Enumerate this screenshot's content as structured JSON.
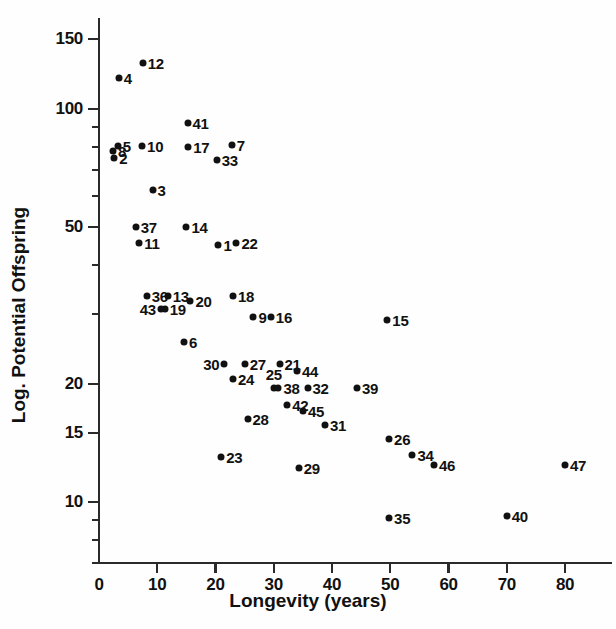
{
  "chart_data": {
    "type": "scatter",
    "title": "",
    "xlabel": "Longevity (years)",
    "ylabel": "Log. Potential Offspring",
    "xlim": [
      0,
      86
    ],
    "ylim": [
      7.0,
      170
    ],
    "yscale": "log",
    "xscale": "linear",
    "grid": false,
    "legend": "none",
    "xticks": [
      0,
      10,
      20,
      30,
      40,
      50,
      60,
      70,
      80
    ],
    "xticklabels": [
      "0",
      "10",
      "20",
      "30",
      "40",
      "50",
      "60",
      "70",
      "80"
    ],
    "yticks_major": [
      150,
      100,
      50,
      20,
      15,
      10
    ],
    "yticklabels": [
      "150",
      "100",
      "50",
      "20",
      "15",
      "10"
    ],
    "yticks_minor": [
      90,
      80,
      70,
      60,
      40,
      30,
      9,
      8,
      7
    ],
    "point_label_note": "Each marker is annotated with its species index number.",
    "points": [
      {
        "label": "1",
        "x": 20.5,
        "y": 45.0,
        "pos": "r"
      },
      {
        "label": "2",
        "x": 2.6,
        "y": 75.0,
        "pos": "r"
      },
      {
        "label": "3",
        "x": 9.2,
        "y": 62.0,
        "pos": "r"
      },
      {
        "label": "4",
        "x": 3.4,
        "y": 120.0,
        "pos": "r"
      },
      {
        "label": "5",
        "x": 3.2,
        "y": 80.5,
        "pos": "r"
      },
      {
        "label": "6",
        "x": 14.6,
        "y": 25.5,
        "pos": "r"
      },
      {
        "label": "7",
        "x": 22.8,
        "y": 81.0,
        "pos": "r"
      },
      {
        "label": "8",
        "x": 2.4,
        "y": 78.0,
        "pos": "r"
      },
      {
        "label": "9",
        "x": 26.5,
        "y": 29.5,
        "pos": "r"
      },
      {
        "label": "10",
        "x": 7.4,
        "y": 80.5,
        "pos": "r"
      },
      {
        "label": "11",
        "x": 6.9,
        "y": 45.5,
        "pos": "r"
      },
      {
        "label": "12",
        "x": 7.5,
        "y": 131.0,
        "pos": "r"
      },
      {
        "label": "13",
        "x": 11.8,
        "y": 33.5,
        "pos": "r"
      },
      {
        "label": "14",
        "x": 15.0,
        "y": 50.0,
        "pos": "r"
      },
      {
        "label": "15",
        "x": 49.5,
        "y": 29.0,
        "pos": "r"
      },
      {
        "label": "16",
        "x": 29.5,
        "y": 29.5,
        "pos": "r"
      },
      {
        "label": "17",
        "x": 15.3,
        "y": 80.0,
        "pos": "r"
      },
      {
        "label": "18",
        "x": 23.0,
        "y": 33.5,
        "pos": "r"
      },
      {
        "label": "19",
        "x": 11.3,
        "y": 31.0,
        "pos": "r"
      },
      {
        "label": "20",
        "x": 15.7,
        "y": 32.5,
        "pos": "r"
      },
      {
        "label": "21",
        "x": 31.0,
        "y": 22.5,
        "pos": "r"
      },
      {
        "label": "22",
        "x": 23.6,
        "y": 45.5,
        "pos": "r"
      },
      {
        "label": "23",
        "x": 21.0,
        "y": 13.0,
        "pos": "r"
      },
      {
        "label": "24",
        "x": 23.0,
        "y": 20.5,
        "pos": "r"
      },
      {
        "label": "25",
        "x": 30.0,
        "y": 19.5,
        "pos": "t"
      },
      {
        "label": "26",
        "x": 49.8,
        "y": 14.5,
        "pos": "r"
      },
      {
        "label": "27",
        "x": 25.0,
        "y": 22.5,
        "pos": "r"
      },
      {
        "label": "28",
        "x": 25.5,
        "y": 16.3,
        "pos": "r"
      },
      {
        "label": "29",
        "x": 34.3,
        "y": 12.2,
        "pos": "r"
      },
      {
        "label": "30",
        "x": 21.5,
        "y": 22.5,
        "pos": "l"
      },
      {
        "label": "31",
        "x": 38.8,
        "y": 15.7,
        "pos": "r"
      },
      {
        "label": "32",
        "x": 35.8,
        "y": 19.5,
        "pos": "r"
      },
      {
        "label": "33",
        "x": 20.2,
        "y": 74.0,
        "pos": "r"
      },
      {
        "label": "34",
        "x": 53.8,
        "y": 13.2,
        "pos": "r"
      },
      {
        "label": "35",
        "x": 49.8,
        "y": 9.1,
        "pos": "r"
      },
      {
        "label": "36",
        "x": 8.2,
        "y": 33.5,
        "pos": "r"
      },
      {
        "label": "37",
        "x": 6.3,
        "y": 50.0,
        "pos": "r"
      },
      {
        "label": "38",
        "x": 30.8,
        "y": 19.5,
        "pos": "r"
      },
      {
        "label": "39",
        "x": 44.3,
        "y": 19.5,
        "pos": "r"
      },
      {
        "label": "40",
        "x": 70.0,
        "y": 9.2,
        "pos": "r"
      },
      {
        "label": "41",
        "x": 15.2,
        "y": 92.0,
        "pos": "r"
      },
      {
        "label": "42",
        "x": 32.3,
        "y": 17.7,
        "pos": "r"
      },
      {
        "label": "43",
        "x": 10.6,
        "y": 31.0,
        "pos": "l"
      },
      {
        "label": "44",
        "x": 34.0,
        "y": 21.5,
        "pos": "r"
      },
      {
        "label": "45",
        "x": 35.0,
        "y": 17.0,
        "pos": "r"
      },
      {
        "label": "46",
        "x": 57.5,
        "y": 12.4,
        "pos": "r"
      },
      {
        "label": "47",
        "x": 80.0,
        "y": 12.4,
        "pos": "r"
      }
    ]
  },
  "axes": {
    "x_title": "Longevity (years)",
    "y_title": "Log. Potential Offspring"
  }
}
